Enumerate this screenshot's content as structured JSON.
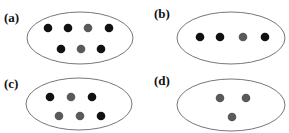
{
  "colors": {
    "black_dot": "#111111",
    "gray_dot": "#5a5a5a",
    "outline": "#777777"
  },
  "panels": [
    {
      "label": "(a)",
      "label_pos": [
        4,
        22
      ],
      "ellipse": {
        "cx": 80,
        "cy": 38,
        "rx": 53,
        "ry": 26
      },
      "dots": [
        {
          "x": 48,
          "y": 28,
          "color": "black"
        },
        {
          "x": 68,
          "y": 28,
          "color": "black"
        },
        {
          "x": 88,
          "y": 28,
          "color": "gray"
        },
        {
          "x": 109,
          "y": 28,
          "color": "black"
        },
        {
          "x": 61,
          "y": 49,
          "color": "black"
        },
        {
          "x": 81,
          "y": 49,
          "color": "gray"
        },
        {
          "x": 101,
          "y": 49,
          "color": "black"
        }
      ]
    },
    {
      "label": "(b)",
      "label_pos": [
        154,
        18
      ],
      "ellipse": {
        "cx": 231,
        "cy": 38,
        "rx": 54,
        "ry": 26
      },
      "dots": [
        {
          "x": 200,
          "y": 37,
          "color": "black"
        },
        {
          "x": 220,
          "y": 37,
          "color": "black"
        },
        {
          "x": 243,
          "y": 37,
          "color": "gray"
        },
        {
          "x": 265,
          "y": 37,
          "color": "black"
        }
      ]
    },
    {
      "label": "(c)",
      "label_pos": [
        4,
        88
      ],
      "ellipse": {
        "cx": 79,
        "cy": 104,
        "rx": 53,
        "ry": 26
      },
      "dots": [
        {
          "x": 50,
          "y": 97,
          "color": "black"
        },
        {
          "x": 71,
          "y": 97,
          "color": "gray"
        },
        {
          "x": 92,
          "y": 97,
          "color": "black"
        },
        {
          "x": 59,
          "y": 116,
          "color": "gray"
        },
        {
          "x": 80,
          "y": 116,
          "color": "gray"
        },
        {
          "x": 101,
          "y": 116,
          "color": "black"
        }
      ]
    },
    {
      "label": "(d)",
      "label_pos": [
        154,
        85
      ],
      "ellipse": {
        "cx": 231,
        "cy": 105,
        "rx": 54,
        "ry": 26
      },
      "dots": [
        {
          "x": 220,
          "y": 98,
          "color": "gray"
        },
        {
          "x": 246,
          "y": 98,
          "color": "gray"
        },
        {
          "x": 232,
          "y": 117,
          "color": "gray"
        }
      ]
    }
  ]
}
